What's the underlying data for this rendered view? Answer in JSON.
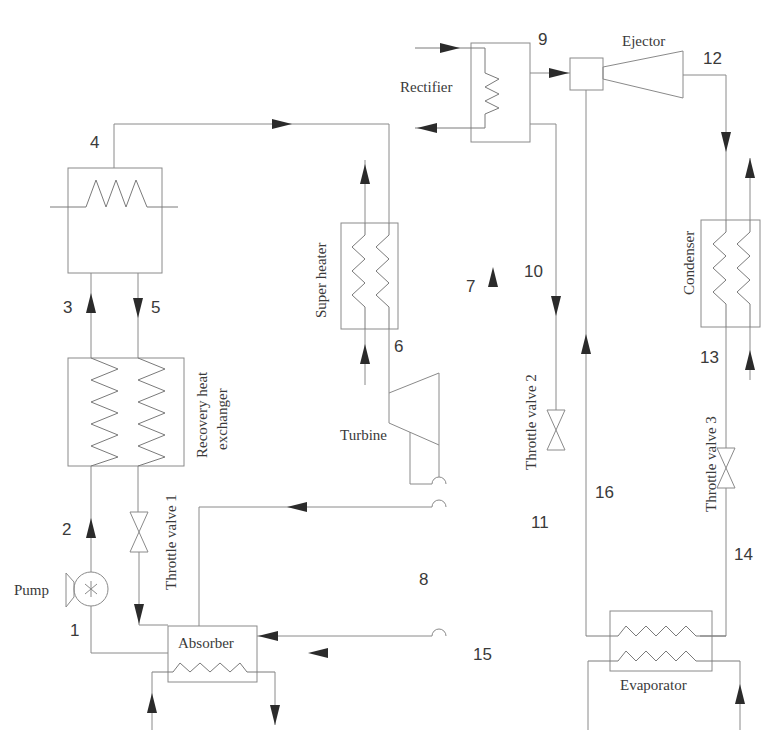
{
  "diagram": {
    "type": "process-flow-schematic",
    "components": {
      "rectifier": "Rectifier",
      "ejector": "Ejector",
      "super_heater": "Super heater",
      "condenser": "Condenser",
      "turbine": "Turbine",
      "recovery_heat_exchanger_line1": "Recovery heat",
      "recovery_heat_exchanger_line2": "exchanger",
      "throttle_valve_1": "Throttle valve 1",
      "throttle_valve_2": "Throttle valve 2",
      "throttle_valve_3": "Throttle valve 3",
      "pump": "Pump",
      "absorber": "Absorber",
      "evaporator": "Evaporator"
    },
    "state_points": {
      "p1": "1",
      "p2": "2",
      "p3": "3",
      "p4": "4",
      "p5": "5",
      "p6": "6",
      "p7": "7",
      "p8": "8",
      "p9": "9",
      "p10": "10",
      "p11": "11",
      "p12": "12",
      "p13": "13",
      "p14": "14",
      "p15": "15",
      "p16": "16"
    },
    "colors": {
      "line": "#8a8a8a",
      "arrow": "#2b2b2b",
      "text": "#3a3a3a",
      "background": "#ffffff"
    }
  }
}
